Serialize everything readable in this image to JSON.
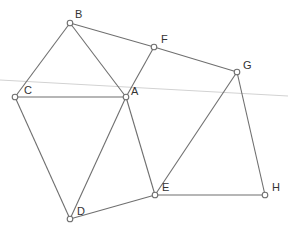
{
  "diagram": {
    "type": "geometric-graph",
    "points": [
      {
        "id": "A",
        "label": "A",
        "x": 126,
        "y": 97,
        "lx": 131,
        "ly": 95
      },
      {
        "id": "B",
        "label": "B",
        "x": 70,
        "y": 23,
        "lx": 75,
        "ly": 18
      },
      {
        "id": "C",
        "label": "C",
        "x": 15,
        "y": 97,
        "lx": 24,
        "ly": 94
      },
      {
        "id": "D",
        "label": "D",
        "x": 70,
        "y": 219,
        "lx": 77,
        "ly": 215
      },
      {
        "id": "E",
        "label": "E",
        "x": 155,
        "y": 195,
        "lx": 162,
        "ly": 191
      },
      {
        "id": "F",
        "label": "F",
        "x": 154,
        "y": 47,
        "lx": 161,
        "ly": 43
      },
      {
        "id": "G",
        "label": "G",
        "x": 237,
        "y": 72,
        "lx": 243,
        "ly": 69
      },
      {
        "id": "H",
        "label": "H",
        "x": 265,
        "y": 195,
        "lx": 272,
        "ly": 191
      }
    ],
    "edges": [
      [
        "B",
        "C"
      ],
      [
        "B",
        "A"
      ],
      [
        "B",
        "F"
      ],
      [
        "F",
        "G"
      ],
      [
        "F",
        "A"
      ],
      [
        "C",
        "A"
      ],
      [
        "C",
        "D"
      ],
      [
        "A",
        "D"
      ],
      [
        "A",
        "E"
      ],
      [
        "D",
        "E"
      ],
      [
        "G",
        "E"
      ],
      [
        "G",
        "H"
      ],
      [
        "E",
        "H"
      ]
    ],
    "background_line": {
      "x1": 0,
      "y1": 80,
      "x2": 288,
      "y2": 96
    },
    "colors": {
      "edge": "#6f6f6f",
      "point_fill": "#ffffff",
      "label": "#333333",
      "faint_line": "#d2d2d2"
    }
  }
}
